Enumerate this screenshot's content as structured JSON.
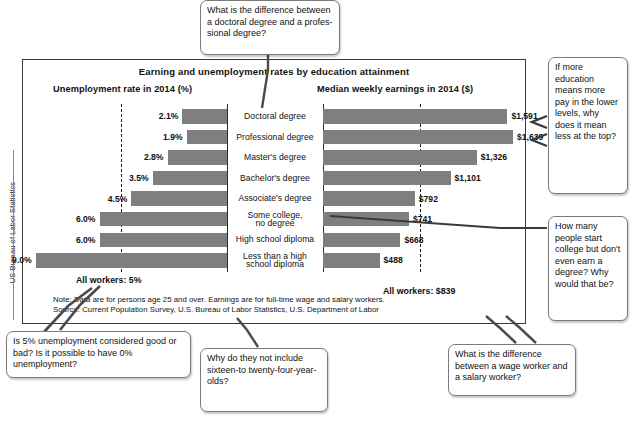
{
  "credit": {
    "text": "US Bureau of Labor Statistics"
  },
  "chart_data": {
    "type": "bar",
    "title": "Earning and unemployment rates by education attainment",
    "orientation": "horizontal",
    "grid": false,
    "legend": "none",
    "panels": [
      {
        "name": "unemployment",
        "header": "Unemployment rate in 2014 (%)",
        "xlabel": "",
        "ylabel": "",
        "unit": "percent",
        "direction": "right-to-left",
        "xlim": [
          0,
          9.6
        ],
        "reference_line": {
          "value": 5,
          "label": "All workers: 5%",
          "style": "dashed"
        }
      },
      {
        "name": "earnings",
        "header": "Median weekly earnings in 2014 ($)",
        "xlabel": "",
        "ylabel": "",
        "unit": "dollars-per-week",
        "direction": "left-to-right",
        "xlim": [
          0,
          1760
        ],
        "reference_line": {
          "value": 839,
          "label": "All workers: $839",
          "style": "dashed"
        }
      }
    ],
    "categories": [
      "Doctoral degree",
      "Professional degree",
      "Master's degree",
      "Bachelor's degree",
      "Associate's degree",
      "Some college,\nno degree",
      "High school diploma",
      "Less than a high\nschool diploma"
    ],
    "series": [
      {
        "name": "Unemployment rate in 2014 (%)",
        "values": [
          2.1,
          1.9,
          2.8,
          3.5,
          4.5,
          6.0,
          6.0,
          9.0
        ],
        "labels": [
          "2.1%",
          "1.9%",
          "2.8%",
          "3.5%",
          "4.5%",
          "6.0%",
          "6.0%",
          "9.0%"
        ]
      },
      {
        "name": "Median weekly earnings in 2014 ($)",
        "values": [
          1591,
          1639,
          1326,
          1101,
          792,
          741,
          668,
          488
        ],
        "labels": [
          "$1,591",
          "$1,639",
          "$1,326",
          "$1,101",
          "$792",
          "$741",
          "$668",
          "$488"
        ]
      }
    ],
    "annotations": {
      "all_workers_unemployment": "All workers: 5%",
      "all_workers_earnings": "All workers: $839",
      "note": "Note: Data are for persons age 25 and over. Earnings are for full-time wage and salary workers.",
      "source": "Source: Current Population Survey, U.S. Bureau of Labor Statistics, U.S. Department of Labor"
    },
    "colors": {
      "bar": "#7f7f7f",
      "frame": "#3b3b3b",
      "text": "#111111",
      "reference": "#1a1a1a"
    }
  },
  "callouts": [
    {
      "id": "doctoral-vs-professional",
      "text": "What is the difference between a doctoral degree and a profes-sional degree?"
    },
    {
      "id": "more-education-more-pay",
      "text": "If more education means more pay in the lower levels, why does it mean less at the top?"
    },
    {
      "id": "college-no-degree",
      "text": "How many people start college but don't even earn a degree? Why would that be?"
    },
    {
      "id": "five-percent-unemployment",
      "text": "Is 5% unemployment considered good or bad? Is it possible to have 0% unemployment?"
    },
    {
      "id": "age-range",
      "text": "Why do they not include sixteen-to twenty-four-year-olds?"
    },
    {
      "id": "wage-vs-salary",
      "text": "What is the difference between a wage worker and a salary worker?"
    }
  ]
}
